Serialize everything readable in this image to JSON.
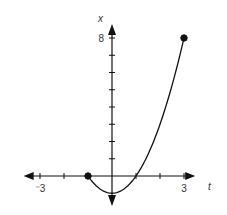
{
  "chart_data": {
    "type": "line",
    "title": "",
    "xlabel": "t",
    "ylabel": "x",
    "function": "x = t^2 - 1",
    "domain": [
      -1,
      3
    ],
    "xlim": [
      -3.1,
      3.3
    ],
    "ylim": [
      -1.7,
      9.2
    ],
    "x_ticks": [
      -3,
      -2,
      -1,
      1,
      2,
      3
    ],
    "x_tick_labels": [
      {
        "value": -3,
        "label": "⁻3"
      },
      {
        "value": 3,
        "label": "3"
      }
    ],
    "y_ticks": [
      1,
      2,
      3,
      4,
      5,
      6,
      7,
      8
    ],
    "y_tick_labels": [
      {
        "value": 8,
        "label": "8"
      }
    ],
    "series": [
      {
        "name": "x(t)",
        "x": [
          -1,
          -0.5,
          0,
          0.5,
          1,
          1.5,
          2,
          2.5,
          3
        ],
        "values": [
          0,
          -0.75,
          -1,
          -0.75,
          0,
          1.25,
          3,
          5.25,
          8
        ]
      }
    ],
    "endpoints": [
      {
        "t": -1,
        "x": 0,
        "filled": true
      },
      {
        "t": 3,
        "x": 8,
        "filled": true
      }
    ],
    "grid": false,
    "legend": null
  },
  "layout": {
    "origin_px": [
      112,
      176
    ],
    "unit_x_px": 24,
    "unit_y_px": 17.25,
    "line_color": "#111111"
  }
}
